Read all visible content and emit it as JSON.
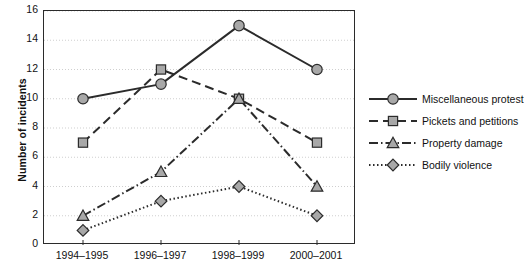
{
  "chart_data": {
    "type": "line",
    "title": "",
    "subtitle": "",
    "xlabel": "",
    "ylabel": "Number of incidents",
    "categories": [
      "1994–1995",
      "1996–1997",
      "1998–1999",
      "2000–2001"
    ],
    "ylim": [
      0,
      16
    ],
    "ytick_step": 2,
    "yticks": [
      0,
      2,
      4,
      6,
      8,
      10,
      12,
      14,
      16
    ],
    "ytick_labels": [
      "0",
      "2",
      "4",
      "6",
      "8",
      "10",
      "12",
      "14",
      "16"
    ],
    "grid": true,
    "grid_axis": "y",
    "grid_style": "dotted",
    "legend_position": "right",
    "series": [
      {
        "name": "Miscellaneous protest",
        "values": [
          10,
          11,
          15,
          12
        ],
        "marker": "circle",
        "line_style": "solid",
        "color": "#2b2b2b",
        "marker_fill": "#a8a8a8"
      },
      {
        "name": "Pickets and petitions",
        "values": [
          7,
          12,
          10,
          7
        ],
        "marker": "square",
        "line_style": "dashed",
        "color": "#2b2b2b",
        "marker_fill": "#a8a8a8"
      },
      {
        "name": "Property damage",
        "values": [
          2,
          5,
          10,
          4
        ],
        "marker": "triangle",
        "line_style": "dash-dot",
        "color": "#2b2b2b",
        "marker_fill": "#a8a8a8"
      },
      {
        "name": "Bodily violence",
        "values": [
          1,
          3,
          4,
          2
        ],
        "marker": "diamond",
        "line_style": "dotted",
        "color": "#2b2b2b",
        "marker_fill": "#a8a8a8"
      }
    ]
  },
  "legend": {
    "items": [
      {
        "label": "Miscellaneous protest"
      },
      {
        "label": "Pickets and petitions"
      },
      {
        "label": "Property damage"
      },
      {
        "label": "Bodily violence"
      }
    ]
  },
  "colors": {
    "axis": "#2b2b2b",
    "grid": "#cfcfcf",
    "marker_fill": "#a8a8a8",
    "text": "#111111",
    "background": "#ffffff"
  }
}
